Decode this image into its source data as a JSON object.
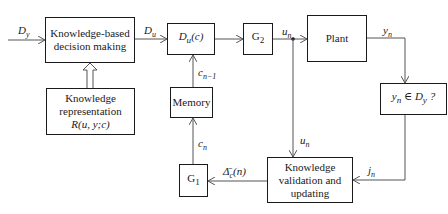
{
  "blocks": {
    "decision": {
      "line1": "Knowledge-based",
      "line2": "decision making"
    },
    "representation": {
      "line1": "Knowledge",
      "line2": "representation",
      "line3": "R(u, y;c)"
    },
    "du": {
      "main": "D",
      "sub": "u",
      "tail": "(c)"
    },
    "g2": {
      "main": "G",
      "sub": "2"
    },
    "plant": {
      "label": "Plant"
    },
    "check": {
      "a": "y",
      "a_sub": "n",
      "mid": " ∈ D",
      "b_sub": "y",
      "tail": " ?"
    },
    "memory": {
      "label": "Memory"
    },
    "g1": {
      "main": "G",
      "sub": "1"
    },
    "validation": {
      "line1": "Knowledge",
      "line2": "validation and",
      "line3": "updating"
    }
  },
  "signals": {
    "dy": {
      "main": "D",
      "sub": "y"
    },
    "du": {
      "main": "D",
      "sub": "u"
    },
    "un_top": {
      "main": "u",
      "sub": "n"
    },
    "yn": {
      "main": "y",
      "sub": "n"
    },
    "cn1": {
      "main": "c",
      "sub": "n−1"
    },
    "cn": {
      "main": "c",
      "sub": "n"
    },
    "un_down": {
      "main": "u",
      "sub": "n"
    },
    "jn": {
      "main": "j",
      "sub": "n"
    },
    "delta": {
      "main": "Δ̄",
      "sub": "c",
      "tail": "(n)"
    }
  },
  "colors": {
    "stroke": "#1a1a1a",
    "wire": "#555555"
  }
}
